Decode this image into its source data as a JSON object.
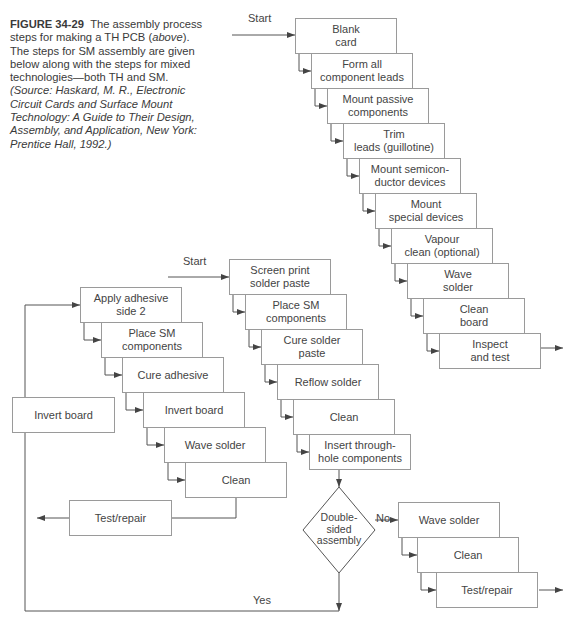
{
  "caption": {
    "figure_label": "FIGURE 34-29",
    "text": "The assembly process steps for making a TH PCB (",
    "above": "above",
    "text2": "). The steps for SM assembly are given below along with the steps for mixed technologies—both TH and SM.",
    "source": "(Source: Haskard, M. R., Electronic Circuit Cards and Surface Mount Technology: A Guide to Their Design, Assembly, and Application, New York: Prentice Hall, 1992.)"
  },
  "labels": {
    "start_th": "Start",
    "start_sm": "Start",
    "no": "No",
    "yes": "Yes"
  },
  "th_steps": [
    "Blank\ncard",
    "Form all\ncomponent leads",
    "Mount passive\ncomponents",
    "Trim\nleads (guillotine)",
    "Mount semicon-\nductor devices",
    "Mount\nspecial devices",
    "Vapour\nclean (optional)",
    "Wave\nsolder",
    "Clean\nboard",
    "Inspect\nand test"
  ],
  "sm_steps": [
    "Screen print\nsolder paste",
    "Place SM\ncomponents",
    "Cure solder\npaste",
    "Reflow solder",
    "Clean",
    "Insert through-\nhole components"
  ],
  "decision": "Double-\nsided\nassembly",
  "no_branch": [
    "Wave solder",
    "Clean",
    "Test/repair"
  ],
  "side2_steps": [
    "Apply adhesive\nside 2",
    "Place SM\ncomponents",
    "Cure adhesive",
    "Invert board",
    "Wave solder",
    "Clean"
  ],
  "side2_test": "Test/repair",
  "invert_loop": "Invert board"
}
